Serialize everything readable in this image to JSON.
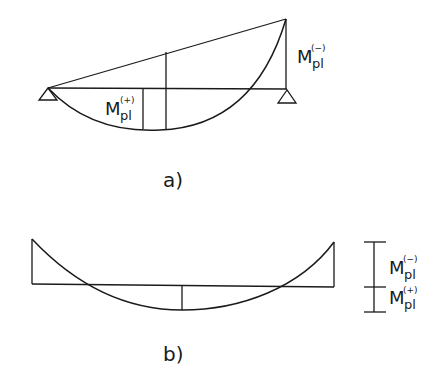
{
  "diagram_a": {
    "caption": "a)",
    "label_negative": {
      "main": "M",
      "sub": "pl",
      "sup": "(−)"
    },
    "label_positive": {
      "main": "M",
      "sub": "pl",
      "sup": "(+)"
    }
  },
  "diagram_b": {
    "caption": "b)",
    "label_negative": {
      "main": "M",
      "sub": "pl",
      "sup": "(−)"
    },
    "label_positive": {
      "main": "M",
      "sub": "pl",
      "sup": "(+)"
    }
  },
  "colors": {
    "line": "#1a1a1a",
    "background": "#ffffff"
  }
}
